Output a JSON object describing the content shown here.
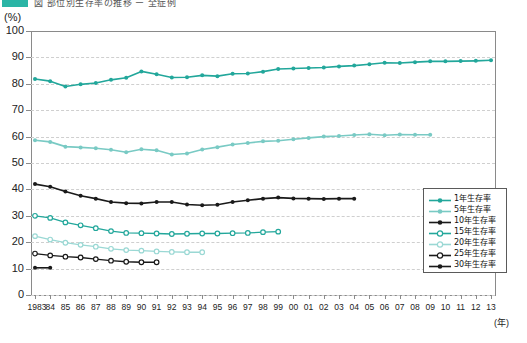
{
  "top_strip": {
    "swatch_color": "#2bb5a6",
    "cropped_caption": "図 部位別生存率の推移 ー 全症例"
  },
  "axis": {
    "y_unit": "(%)",
    "x_unit": "(年)",
    "y_ticks": [
      "0",
      "10",
      "20",
      "30",
      "40",
      "50",
      "60",
      "70",
      "80",
      "90",
      "100"
    ],
    "x_tick_labels": [
      "1983",
      "84",
      "85",
      "86",
      "87",
      "88",
      "89",
      "90",
      "91",
      "92",
      "93",
      "94",
      "95",
      "96",
      "97",
      "98",
      "99",
      "00",
      "01",
      "02",
      "03",
      "04",
      "05",
      "06",
      "07",
      "08",
      "09",
      "10",
      "11",
      "12",
      "13"
    ]
  },
  "legend": {
    "items": [
      {
        "label": "1年生存率",
        "color": "#22a79b",
        "marker": "filled"
      },
      {
        "label": "5年生存率",
        "color": "#79cac4",
        "marker": "filled"
      },
      {
        "label": "10年生存率",
        "color": "#1a1a1a",
        "marker": "filled"
      },
      {
        "label": "15年生存率",
        "color": "#22a79b",
        "marker": "hollow"
      },
      {
        "label": "20年生存率",
        "color": "#9ad8d4",
        "marker": "hollow"
      },
      {
        "label": "25年生存率",
        "color": "#1a1a1a",
        "marker": "hollow"
      },
      {
        "label": "30年生存率",
        "color": "#1a1a1a",
        "marker": "filled"
      }
    ]
  },
  "chart_data": {
    "type": "line",
    "title": "部位別生存率の推移",
    "xlabel": "(年)",
    "ylabel": "(%)",
    "ylim": [
      0,
      100
    ],
    "grid": true,
    "legend_position": "inside-right",
    "x": [
      1983,
      1984,
      1985,
      1986,
      1987,
      1988,
      1989,
      1990,
      1991,
      1992,
      1993,
      1994,
      1995,
      1996,
      1997,
      1998,
      1999,
      2000,
      2001,
      2002,
      2003,
      2004,
      2005,
      2006,
      2007,
      2008,
      2009,
      2010,
      2011,
      2012,
      2013
    ],
    "series": [
      {
        "name": "1年生存率",
        "color": "#22a79b",
        "marker": "filled",
        "values": [
          81.8,
          81.0,
          79.0,
          79.8,
          80.3,
          81.5,
          82.3,
          84.7,
          83.6,
          82.4,
          82.5,
          83.2,
          82.9,
          83.8,
          83.9,
          84.6,
          85.6,
          85.8,
          86.0,
          86.2,
          86.6,
          86.9,
          87.4,
          88.0,
          87.9,
          88.2,
          88.5,
          88.5,
          88.6,
          88.7,
          88.9
        ]
      },
      {
        "name": "5年生存率",
        "color": "#79cac4",
        "marker": "filled",
        "values": [
          58.6,
          58.0,
          56.2,
          55.9,
          55.6,
          55.0,
          54.1,
          55.2,
          54.8,
          53.2,
          53.6,
          55.1,
          56.0,
          57.0,
          57.6,
          58.2,
          58.4,
          59.0,
          59.5,
          60.0,
          60.2,
          60.6,
          60.9,
          60.5,
          60.8,
          60.7,
          60.7,
          null,
          null,
          null,
          null
        ]
      },
      {
        "name": "10年生存率",
        "color": "#1a1a1a",
        "marker": "filled",
        "values": [
          42.0,
          41.0,
          39.2,
          37.6,
          36.5,
          35.2,
          34.8,
          34.7,
          35.2,
          35.2,
          34.3,
          34.0,
          34.2,
          35.2,
          35.9,
          36.5,
          36.9,
          36.6,
          36.5,
          36.4,
          36.5,
          36.5,
          null,
          null,
          null,
          null,
          null,
          null,
          null,
          null,
          null
        ]
      },
      {
        "name": "15年生存率",
        "color": "#22a79b",
        "marker": "hollow",
        "values": [
          30.0,
          29.2,
          27.5,
          26.4,
          25.3,
          24.2,
          23.5,
          23.4,
          23.3,
          23.1,
          23.2,
          23.3,
          23.3,
          23.4,
          23.5,
          23.8,
          24.0,
          null,
          null,
          null,
          null,
          null,
          null,
          null,
          null,
          null,
          null,
          null,
          null,
          null,
          null
        ]
      },
      {
        "name": "20年生存率",
        "color": "#9ad8d4",
        "marker": "hollow",
        "values": [
          22.3,
          21.0,
          19.8,
          19.0,
          18.3,
          17.5,
          17.0,
          16.8,
          16.5,
          16.3,
          16.2,
          16.2,
          null,
          null,
          null,
          null,
          null,
          null,
          null,
          null,
          null,
          null,
          null,
          null,
          null,
          null,
          null,
          null,
          null,
          null,
          null
        ]
      },
      {
        "name": "25年生存率",
        "color": "#1a1a1a",
        "marker": "hollow",
        "values": [
          15.7,
          15.0,
          14.5,
          14.2,
          13.6,
          13.0,
          12.6,
          12.4,
          12.4,
          null,
          null,
          null,
          null,
          null,
          null,
          null,
          null,
          null,
          null,
          null,
          null,
          null,
          null,
          null,
          null,
          null,
          null,
          null,
          null,
          null,
          null
        ]
      },
      {
        "name": "30年生存率",
        "color": "#1a1a1a",
        "marker": "filled",
        "values": [
          10.3,
          10.3,
          null,
          null,
          null,
          null,
          null,
          null,
          null,
          null,
          null,
          null,
          null,
          null,
          null,
          null,
          null,
          null,
          null,
          null,
          null,
          null,
          null,
          null,
          null,
          null,
          null,
          null,
          null,
          null,
          null
        ]
      }
    ]
  }
}
